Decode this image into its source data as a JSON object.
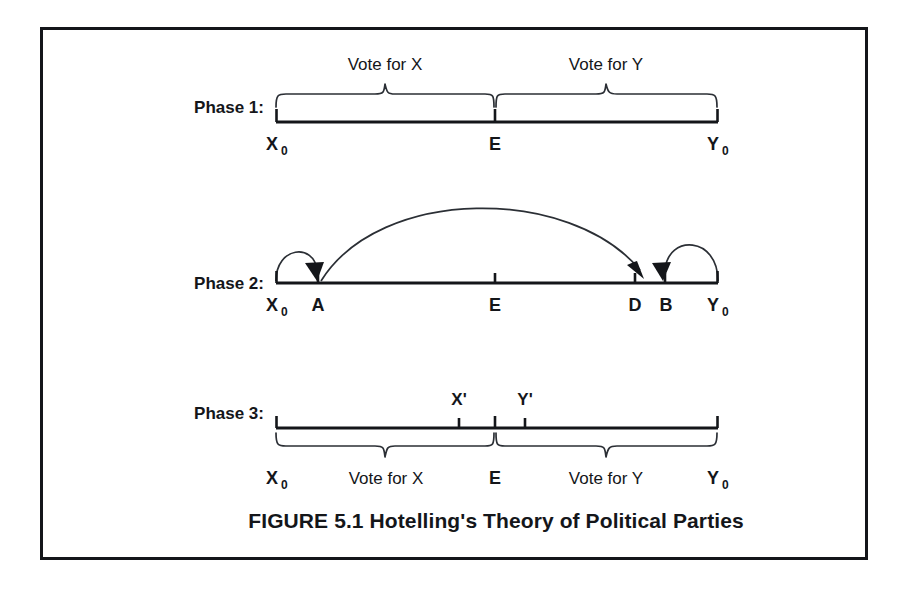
{
  "figure": {
    "caption": "FIGURE 5.1 Hotelling's Theory of Political Parties",
    "border_color": "#14161a",
    "ink_color": "#14161a",
    "background_color": "#ffffff"
  },
  "phases": [
    {
      "id": "phase-1",
      "label": "Phase 1:",
      "axis": {
        "left_label": "X",
        "left_sub": "0",
        "mid_label": "E",
        "right_label": "Y",
        "right_sub": "0"
      },
      "braces_position": "above",
      "braces": [
        {
          "id": "vote-for-x",
          "label": "Vote for X"
        },
        {
          "id": "vote-for-y",
          "label": "Vote for Y"
        }
      ],
      "ticks": [
        {
          "id": "tick-x0",
          "label": "X0"
        },
        {
          "id": "tick-e",
          "label": "E"
        },
        {
          "id": "tick-y0",
          "label": "Y0"
        }
      ],
      "arcs": []
    },
    {
      "id": "phase-2",
      "label": "Phase 2:",
      "axis": {
        "left_label": "X",
        "left_sub": "0",
        "mid_label": "E",
        "right_label": "Y",
        "right_sub": "0"
      },
      "braces_position": "none",
      "braces": [],
      "ticks": [
        {
          "id": "tick-x0",
          "label": "X0"
        },
        {
          "id": "tick-a",
          "label": "A"
        },
        {
          "id": "tick-e",
          "label": "E"
        },
        {
          "id": "tick-d",
          "label": "D"
        },
        {
          "id": "tick-b",
          "label": "B"
        },
        {
          "id": "tick-y0",
          "label": "Y0"
        }
      ],
      "tick_labels": [
        "X0",
        "A",
        "E",
        "D",
        "B",
        "Y0"
      ],
      "arcs": [
        {
          "id": "arc-x0-to-a",
          "from": "X0",
          "to": "A",
          "size": "small"
        },
        {
          "id": "arc-a-to-d",
          "from": "A",
          "to": "D",
          "size": "large"
        },
        {
          "id": "arc-y0-to-b",
          "from": "Y0",
          "to": "B",
          "size": "small"
        }
      ]
    },
    {
      "id": "phase-3",
      "label": "Phase 3:",
      "axis": {
        "left_label": "X",
        "left_sub": "0",
        "mid_label": "E",
        "right_label": "Y",
        "right_sub": "0"
      },
      "braces_position": "below",
      "braces": [
        {
          "id": "vote-for-x",
          "label": "Vote for X"
        },
        {
          "id": "vote-for-y",
          "label": "Vote for Y"
        }
      ],
      "ticks": [
        {
          "id": "tick-x-prime",
          "label": "X'"
        },
        {
          "id": "tick-e",
          "label": "E"
        },
        {
          "id": "tick-y-prime",
          "label": "Y'"
        }
      ],
      "above_labels": [
        {
          "id": "x-prime",
          "label": "X'"
        },
        {
          "id": "y-prime",
          "label": "Y'"
        }
      ],
      "below_labels": [
        {
          "id": "x0",
          "label": "X",
          "sub": "0"
        },
        {
          "id": "e",
          "label": "E"
        },
        {
          "id": "y0",
          "label": "Y",
          "sub": "0"
        }
      ],
      "arcs": []
    }
  ],
  "labels": {
    "phase1_title": "Phase 1:",
    "phase2_title": "Phase 2:",
    "phase3_title": "Phase 3:",
    "vote_for_x": "Vote for X",
    "vote_for_y": "Vote for Y",
    "x_zero": "X",
    "y_zero": "Y",
    "subscript_zero": "0",
    "e": "E",
    "a": "A",
    "b": "B",
    "d": "D",
    "x_prime": "X'",
    "y_prime": "Y'"
  }
}
